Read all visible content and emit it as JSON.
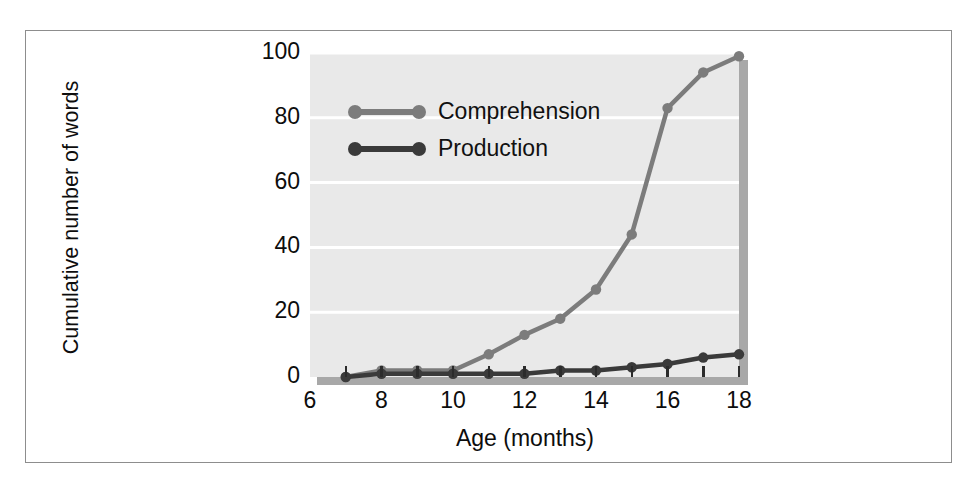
{
  "figure": {
    "background_color": "#ffffff",
    "border_color": "#8d8d8d",
    "plot_background": "#e9e9e9",
    "gridline_color": "#ffffff",
    "shadow_color": "#a8a8a8"
  },
  "chart_data": {
    "type": "line",
    "title": "",
    "xlabel": "Age (months)",
    "ylabel": "Cumulative number of words",
    "xlim": [
      6,
      18
    ],
    "ylim": [
      0,
      100
    ],
    "xticks": [
      6,
      8,
      10,
      12,
      14,
      16,
      18
    ],
    "xtick_labels": [
      "6",
      "8",
      "10",
      "12",
      "14",
      "16",
      "18"
    ],
    "yticks": [
      0,
      20,
      40,
      60,
      80,
      100
    ],
    "ytick_labels": [
      "0",
      "20",
      "40",
      "60",
      "80",
      "100"
    ],
    "minor_xticks": [
      7,
      8,
      9,
      10,
      11,
      12,
      13,
      14,
      15,
      16,
      17,
      18
    ],
    "grid": true,
    "grid_axis": "y",
    "legend_position": "upper left",
    "x": [
      7,
      8,
      9,
      10,
      11,
      12,
      13,
      14,
      15,
      16,
      17,
      18
    ],
    "series": [
      {
        "name": "Comprehension",
        "color": "#7c7c7c",
        "marker": "circle",
        "values": [
          0,
          2,
          2,
          2,
          7,
          13,
          18,
          27,
          44,
          83,
          94,
          99
        ]
      },
      {
        "name": "Production",
        "color": "#3a3a3a",
        "marker": "circle",
        "values": [
          0,
          1,
          1,
          1,
          1,
          1,
          2,
          2,
          3,
          4,
          6,
          7
        ]
      }
    ]
  },
  "legend": {
    "items": [
      {
        "label": "Comprehension",
        "color": "#7c7c7c"
      },
      {
        "label": "Production",
        "color": "#3a3a3a"
      }
    ]
  }
}
